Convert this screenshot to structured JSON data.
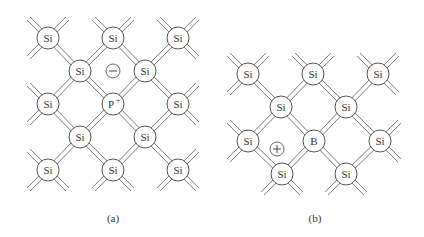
{
  "figure": {
    "panels": [
      {
        "id": "a",
        "caption": "(a)",
        "caption_pos": [
          113,
          212
        ],
        "dopant": "P+",
        "carrier": "electron",
        "atoms": [
          {
            "label": "Si",
            "x": 48,
            "y": 38
          },
          {
            "label": "Si",
            "x": 113,
            "y": 38
          },
          {
            "label": "Si",
            "x": 178,
            "y": 38
          },
          {
            "label": "Si",
            "x": 80,
            "y": 71
          },
          {
            "label": "Si",
            "x": 145,
            "y": 71
          },
          {
            "label": "Si",
            "x": 48,
            "y": 104
          },
          {
            "label": "P",
            "sup": "+",
            "x": 113,
            "y": 104
          },
          {
            "label": "Si",
            "x": 178,
            "y": 104
          },
          {
            "label": "Si",
            "x": 80,
            "y": 137
          },
          {
            "label": "Si",
            "x": 145,
            "y": 137
          },
          {
            "label": "Si",
            "x": 48,
            "y": 170
          },
          {
            "label": "Si",
            "x": 113,
            "y": 170
          },
          {
            "label": "Si",
            "x": 178,
            "y": 170
          }
        ],
        "charges": [
          {
            "sign": "minus",
            "x": 113,
            "y": 71
          }
        ]
      },
      {
        "id": "b",
        "caption": "(b)",
        "caption_pos": [
          315,
          212
        ],
        "dopant": "B",
        "carrier": "hole",
        "atoms": [
          {
            "label": "Si",
            "x": 248,
            "y": 74
          },
          {
            "label": "Si",
            "x": 313,
            "y": 74
          },
          {
            "label": "Si",
            "x": 378,
            "y": 74
          },
          {
            "label": "Si",
            "x": 281,
            "y": 107
          },
          {
            "label": "Si",
            "x": 346,
            "y": 107
          },
          {
            "label": "Si",
            "x": 248,
            "y": 141
          },
          {
            "label": "B",
            "x": 314,
            "y": 141
          },
          {
            "label": "Si",
            "x": 380,
            "y": 141
          },
          {
            "label": "Si",
            "x": 282,
            "y": 174
          },
          {
            "label": "Si",
            "x": 346,
            "y": 174
          }
        ],
        "charges": [
          {
            "sign": "plus",
            "x": 277,
            "y": 149
          }
        ]
      }
    ],
    "style": {
      "atom_radius": 11,
      "charge_radius": 7,
      "bond_gap": 2.2,
      "bond_stub": 22,
      "line_color": "#6a6a6a",
      "atom_stroke": "#555555"
    }
  }
}
